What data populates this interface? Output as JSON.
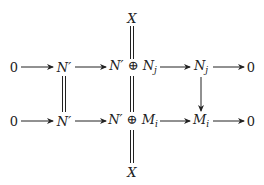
{
  "diagram": {
    "type": "commutative-diagram",
    "nodes": [
      {
        "id": "x_top",
        "label": "X",
        "x": 132,
        "y": 18
      },
      {
        "id": "r1_0a",
        "label": "0",
        "x": 14,
        "y": 67
      },
      {
        "id": "r1_np",
        "label": "N′",
        "x": 64,
        "y": 67
      },
      {
        "id": "r1_sum",
        "label": "N′ ⊕ Nⱼ",
        "x": 133,
        "y": 67
      },
      {
        "id": "r1_nj",
        "label": "Nⱼ",
        "x": 201,
        "y": 67
      },
      {
        "id": "r1_0b",
        "label": "0",
        "x": 251,
        "y": 67
      },
      {
        "id": "r2_0a",
        "label": "0",
        "x": 14,
        "y": 121
      },
      {
        "id": "r2_np",
        "label": "N′",
        "x": 64,
        "y": 121
      },
      {
        "id": "r2_sum",
        "label": "N′ ⊕ Mᵢ",
        "x": 133,
        "y": 121
      },
      {
        "id": "r2_mi",
        "label": "Mᵢ",
        "x": 201,
        "y": 121
      },
      {
        "id": "r2_0b",
        "label": "0",
        "x": 251,
        "y": 121
      },
      {
        "id": "x_bot",
        "label": "X",
        "x": 132,
        "y": 172
      }
    ],
    "edges": [
      {
        "from": "r1_0a",
        "to": "r1_np",
        "style": "arrow"
      },
      {
        "from": "r1_np",
        "to": "r1_sum",
        "style": "arrow"
      },
      {
        "from": "r1_sum",
        "to": "r1_nj",
        "style": "arrow"
      },
      {
        "from": "r1_nj",
        "to": "r1_0b",
        "style": "arrow"
      },
      {
        "from": "r2_0a",
        "to": "r2_np",
        "style": "arrow"
      },
      {
        "from": "r2_np",
        "to": "r2_sum",
        "style": "arrow"
      },
      {
        "from": "r2_sum",
        "to": "r2_mi",
        "style": "arrow"
      },
      {
        "from": "r2_mi",
        "to": "r2_0b",
        "style": "arrow"
      },
      {
        "from": "x_top",
        "to": "r1_sum",
        "style": "double-line"
      },
      {
        "from": "r1_np",
        "to": "r2_np",
        "style": "double-line"
      },
      {
        "from": "r1_sum",
        "to": "r2_sum",
        "style": "double-line"
      },
      {
        "from": "r2_sum",
        "to": "x_bot",
        "style": "double-line"
      },
      {
        "from": "r1_nj",
        "to": "r2_mi",
        "style": "arrow"
      }
    ]
  },
  "labels": {
    "x_top": "X",
    "zero": "0",
    "nprime": "N′",
    "r1_sum_a": "N′",
    "oplus": "⊕",
    "r1_sum_b": "N",
    "sub_j": "j",
    "r2_sum_b": "M",
    "sub_i": "i",
    "x_bot": "X"
  }
}
